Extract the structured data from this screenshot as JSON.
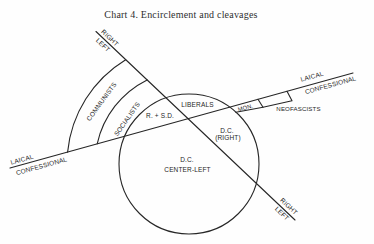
{
  "title": "Chart 4.  Encirclement and cleavages",
  "axes": {
    "left_right": {
      "top": {
        "right": "RIGHT",
        "left": "LEFT"
      },
      "bottom": {
        "right": "RIGHT",
        "left": "LEFT"
      }
    },
    "laical_confessional": {
      "left": {
        "laical": "LAICAL",
        "confessional": "CONFESSIONAL"
      },
      "right": {
        "laical": "LAICAL",
        "confessional": "CONFESSIONAL"
      }
    }
  },
  "regions": {
    "communists": "COMMUNISTS",
    "socialists": "SOCIALISTS",
    "r_sd": "R. + S.D.",
    "liberals": "LIBERALS",
    "dc_right": {
      "line1": "D.C.",
      "line2": "(RIGHT)"
    },
    "dc_center_left": {
      "line1": "D.C.",
      "line2": "CENTER-LEFT"
    },
    "mon": "MON.",
    "neofascists": "NEOFASCISTS"
  },
  "colors": {
    "ink": "#262626",
    "background": "#fefefe"
  }
}
